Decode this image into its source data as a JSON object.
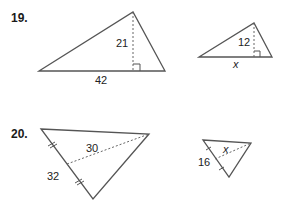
{
  "problems": [
    {
      "number": "19.",
      "figures": [
        {
          "type": "triangle-with-altitude",
          "base_label": "42",
          "height_label": "21",
          "right_angle_marker": true
        },
        {
          "type": "triangle-with-altitude",
          "base_label": "x",
          "height_label": "12",
          "right_angle_marker": true
        }
      ]
    },
    {
      "number": "20.",
      "figures": [
        {
          "type": "triangle-with-median",
          "side_label": "32",
          "median_label": "30",
          "congruence_ticks": true
        },
        {
          "type": "triangle-with-median",
          "side_label": "16",
          "median_label": "x",
          "congruence_ticks": true
        }
      ]
    }
  ],
  "colors": {
    "stroke": "#555555",
    "text": "#1a1a1a",
    "background": "#ffffff"
  }
}
